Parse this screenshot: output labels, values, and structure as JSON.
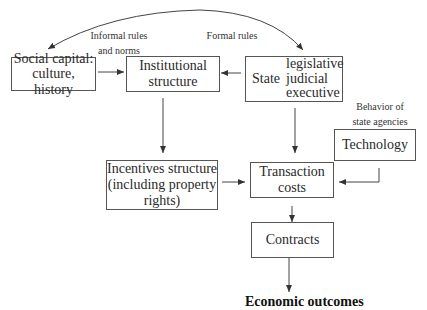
{
  "diagram": {
    "nodes": {
      "social_capital": {
        "line1": "Social capital:",
        "line2": "culture, history"
      },
      "institutional": {
        "line1": "Institutional",
        "line2": "structure"
      },
      "state": {
        "label": "State",
        "branches": [
          "legislative",
          "judicial",
          "executive"
        ]
      },
      "technology": {
        "label": "Technology"
      },
      "incentives": {
        "line1": "Incentives structure",
        "line2": "(including property",
        "line3": "rights)"
      },
      "transaction": {
        "line1": "Transaction",
        "line2": "costs"
      },
      "contracts": {
        "label": "Contracts"
      },
      "outcomes": {
        "label": "Economic outcomes"
      }
    },
    "edge_labels": {
      "informal": {
        "line1": "Informal rules",
        "line2": "and norms"
      },
      "formal": "Formal rules",
      "behavior": {
        "line1": "Behavior of",
        "line2": "state agencies"
      }
    },
    "edges": [
      {
        "from": "state",
        "to": "social_capital",
        "label": "Informal rules and norms"
      },
      {
        "from": "state",
        "to": "state",
        "label": "Formal rules"
      },
      {
        "from": "social_capital",
        "to": "institutional"
      },
      {
        "from": "state",
        "to": "institutional"
      },
      {
        "from": "institutional",
        "to": "incentives"
      },
      {
        "from": "state",
        "to": "transaction",
        "label": "Behavior of state agencies"
      },
      {
        "from": "incentives",
        "to": "transaction"
      },
      {
        "from": "technology",
        "to": "transaction"
      },
      {
        "from": "transaction",
        "to": "contracts"
      },
      {
        "from": "contracts",
        "to": "outcomes"
      }
    ]
  }
}
